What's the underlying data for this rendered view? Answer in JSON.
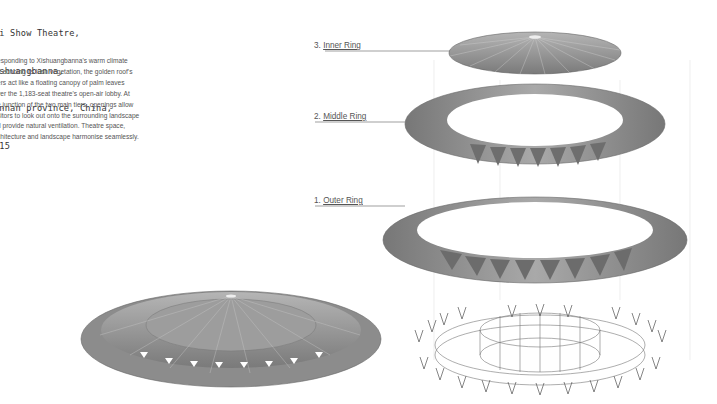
{
  "project": {
    "title_lines": [
      "ai Show Theatre,",
      "ishuangbanna,",
      "unnan province, China,",
      "015"
    ],
    "description_lines": [
      "esponding to Xishuangbanna's warm climate",
      "d echoing its lush vegetation, the golden roof's",
      "ers act like a floating canopy of palm leaves",
      "ver the 1,183-seat theatre's open-air lobby. At",
      "e junction of the two main tiers, openings allow",
      "sitors to look out onto the surrounding landscape",
      "d provide natural ventilation. Theatre space,",
      "chitecture and landscape harmonise seamlessly."
    ]
  },
  "diagram": {
    "labels": [
      {
        "num": "3.",
        "name": "Inner Ring"
      },
      {
        "num": "2.",
        "name": "Middle Ring"
      },
      {
        "num": "1.",
        "name": "Outer Ring"
      }
    ],
    "colors": {
      "roof": "#8a8a8a",
      "roof_light": "#c9c9c9",
      "line": "#888888"
    }
  }
}
